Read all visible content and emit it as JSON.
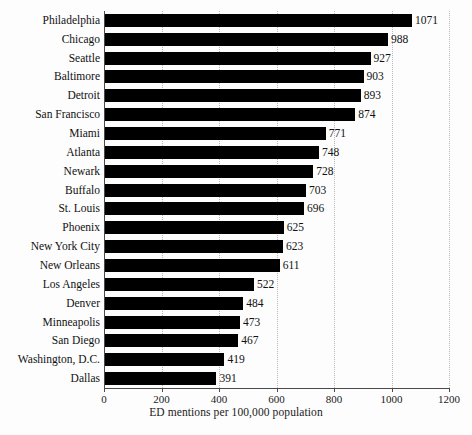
{
  "chart_data": {
    "type": "bar",
    "orientation": "horizontal",
    "title": "",
    "xlabel": "ED mentions per 100,000 population",
    "ylabel": "",
    "xlim": [
      0,
      1200
    ],
    "xticks": [
      0,
      200,
      400,
      600,
      800,
      1000,
      1200
    ],
    "xtick_labels": [
      "0",
      "200",
      "400",
      "600",
      "800",
      "1000",
      "1200"
    ],
    "grid": "vertical-dotted",
    "legend": "none",
    "bar_color": "#000000",
    "categories": [
      "Philadelphia",
      "Chicago",
      "Seattle",
      "Baltimore",
      "Detroit",
      "San Francisco",
      "Miami",
      "Atlanta",
      "Newark",
      "Buffalo",
      "St. Louis",
      "Phoenix",
      "New York City",
      "New Orleans",
      "Los Angeles",
      "Denver",
      "Minneapolis",
      "San Diego",
      "Washington, D.C.",
      "Dallas"
    ],
    "values": [
      1071,
      988,
      927,
      903,
      893,
      874,
      771,
      748,
      728,
      703,
      696,
      625,
      623,
      611,
      522,
      484,
      473,
      467,
      419,
      391
    ],
    "value_labels": [
      "1071",
      "988",
      "927",
      "903",
      "893",
      "874",
      "771",
      "748",
      "728",
      "703",
      "696",
      "625",
      "623",
      "611",
      "522",
      "484",
      "473",
      "467",
      "419",
      "391"
    ]
  }
}
